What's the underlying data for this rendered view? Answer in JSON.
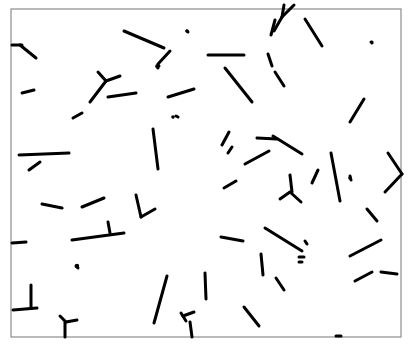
{
  "image": {
    "description": "Black line segments (rods, dots, and Y/T-shaped branches) scattered on a white field inside a thin gray frame",
    "background": "#ffffff",
    "frame_color": "#8c8c8c",
    "stroke_color": "#000000",
    "frame": {
      "x1": 11,
      "y1": 9,
      "x2": 401,
      "y2": 337
    },
    "segments": [
      [
        12,
        45,
        22,
        45
      ],
      [
        20,
        45,
        36,
        58
      ],
      [
        22,
        93,
        34,
        90
      ],
      [
        124,
        31,
        164,
        48
      ],
      [
        158,
        64,
        170,
        51
      ],
      [
        98,
        72,
        106,
        81
      ],
      [
        106,
        81,
        120,
        76
      ],
      [
        90,
        102,
        106,
        81
      ],
      [
        108,
        97,
        136,
        93
      ],
      [
        73,
        118,
        82,
        113
      ],
      [
        168,
        97,
        194,
        89
      ],
      [
        153,
        129,
        158,
        169
      ],
      [
        19,
        155,
        69,
        153
      ],
      [
        29,
        170,
        40,
        162
      ],
      [
        208,
        55,
        244,
        55
      ],
      [
        225,
        68,
        252,
        102
      ],
      [
        271,
        35,
        275,
        20
      ],
      [
        284,
        5,
        282,
        17
      ],
      [
        282,
        17,
        274,
        31
      ],
      [
        294,
        5,
        282,
        17
      ],
      [
        305,
        19,
        322,
        46
      ],
      [
        268,
        54,
        272,
        66
      ],
      [
        275,
        72,
        284,
        86
      ],
      [
        350,
        122,
        364,
        99
      ],
      [
        257,
        138,
        277,
        139
      ],
      [
        273,
        136,
        302,
        154
      ],
      [
        245,
        164,
        269,
        151
      ],
      [
        224,
        188,
        236,
        181
      ],
      [
        222,
        145,
        229,
        132
      ],
      [
        228,
        153,
        232,
        147
      ],
      [
        312,
        183,
        318,
        170
      ],
      [
        331,
        153,
        340,
        201
      ],
      [
        350,
        176,
        351,
        180
      ],
      [
        388,
        153,
        402,
        174
      ],
      [
        402,
        174,
        385,
        192
      ],
      [
        367,
        209,
        377,
        221
      ],
      [
        290,
        175,
        292,
        192
      ],
      [
        290,
        192,
        280,
        199
      ],
      [
        290,
        192,
        301,
        202
      ],
      [
        42,
        204,
        62,
        208
      ],
      [
        82,
        207,
        104,
        198
      ],
      [
        136,
        195,
        141,
        217
      ],
      [
        141,
        217,
        155,
        209
      ],
      [
        12,
        243,
        26,
        242
      ],
      [
        72,
        240,
        124,
        233
      ],
      [
        108,
        222,
        110,
        233
      ],
      [
        76,
        266,
        78,
        268
      ],
      [
        13,
        310,
        37,
        308
      ],
      [
        31,
        285,
        31,
        308
      ],
      [
        60,
        316,
        66,
        322
      ],
      [
        66,
        322,
        77,
        320
      ],
      [
        65,
        322,
        65,
        337
      ],
      [
        154,
        323,
        167,
        276
      ],
      [
        183,
        316,
        194,
        312
      ],
      [
        190,
        322,
        192,
        337
      ],
      [
        205,
        273,
        206,
        299
      ],
      [
        221,
        237,
        243,
        241
      ],
      [
        261,
        254,
        263,
        275
      ],
      [
        244,
        307,
        259,
        326
      ],
      [
        265,
        228,
        302,
        251
      ],
      [
        305,
        241,
        307,
        244
      ],
      [
        299,
        257,
        304,
        257
      ],
      [
        299,
        262,
        302,
        262
      ],
      [
        276,
        278,
        284,
        290
      ],
      [
        350,
        256,
        381,
        240
      ],
      [
        355,
        281,
        372,
        272
      ],
      [
        381,
        272,
        397,
        274
      ],
      [
        181,
        313,
        186,
        321
      ],
      [
        336,
        336,
        341,
        336
      ],
      [
        187,
        31,
        188,
        32
      ],
      [
        158,
        65,
        159,
        66
      ],
      [
        157,
        67,
        158,
        68
      ],
      [
        371,
        42,
        372,
        43
      ],
      [
        176,
        116,
        178,
        117
      ]
    ],
    "dots": [
      {
        "x": 187,
        "y": 31,
        "r": 1.8
      },
      {
        "x": 157,
        "y": 66,
        "r": 1.8
      },
      {
        "x": 372,
        "y": 42,
        "r": 1.5
      },
      {
        "x": 173,
        "y": 117,
        "r": 1.8
      },
      {
        "x": 77,
        "y": 266,
        "r": 2.2
      },
      {
        "x": 350,
        "y": 178,
        "r": 1.8
      }
    ]
  }
}
